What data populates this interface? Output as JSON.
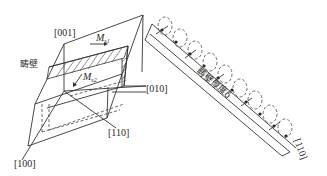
{
  "figure": {
    "type": "crystal domain wall diagram",
    "labels": {
      "dir_001": "[001]",
      "dir_010": "[010]",
      "dir_110": "[110]",
      "dir_100": "[100]",
      "dir_110_right": "[110]",
      "domain_wall": "畴壁",
      "wall_thickness": "畴壁厚度δ",
      "ms1_base": "M",
      "ms1_sub": "s1",
      "ms2_base": "M",
      "ms2_sub": "s2"
    },
    "colors": {
      "line": "#333333",
      "background": "#ffffff"
    }
  }
}
